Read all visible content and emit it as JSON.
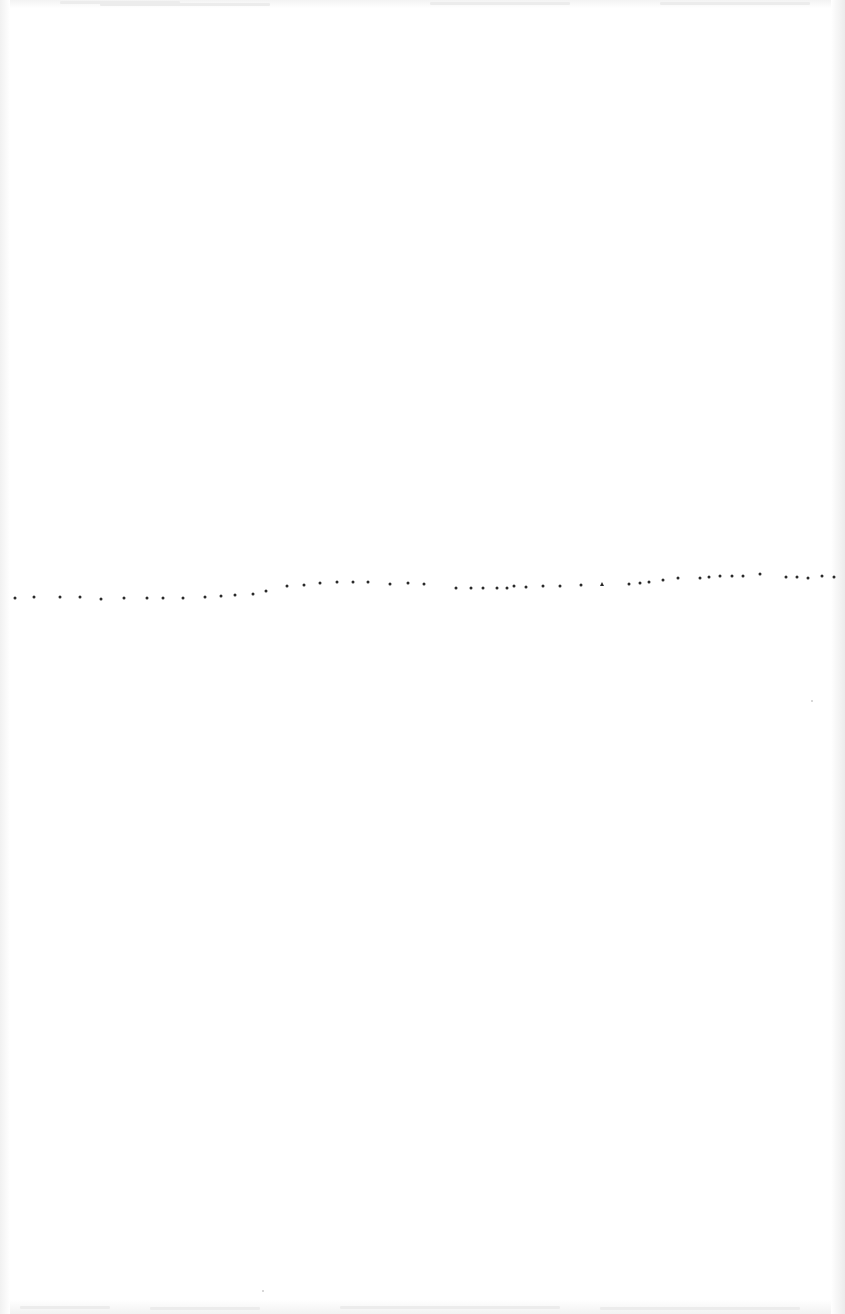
{
  "document": {
    "type": "scanned-page",
    "background_color": "#ffffff",
    "dot_color": "#2a2a2a",
    "visible_text": []
  },
  "dotted_line": {
    "description": "horizontal row of small dots across the middle of the page",
    "points": [
      {
        "x": 15,
        "y": 598
      },
      {
        "x": 34,
        "y": 597
      },
      {
        "x": 60,
        "y": 597
      },
      {
        "x": 80,
        "y": 597
      },
      {
        "x": 101,
        "y": 599
      },
      {
        "x": 124,
        "y": 598
      },
      {
        "x": 147,
        "y": 598
      },
      {
        "x": 163,
        "y": 598
      },
      {
        "x": 183,
        "y": 598
      },
      {
        "x": 205,
        "y": 597
      },
      {
        "x": 221,
        "y": 596
      },
      {
        "x": 235,
        "y": 595
      },
      {
        "x": 253,
        "y": 594
      },
      {
        "x": 266,
        "y": 591
      },
      {
        "x": 287,
        "y": 586
      },
      {
        "x": 304,
        "y": 585
      },
      {
        "x": 320,
        "y": 583
      },
      {
        "x": 337,
        "y": 582
      },
      {
        "x": 353,
        "y": 582
      },
      {
        "x": 368,
        "y": 582
      },
      {
        "x": 390,
        "y": 584
      },
      {
        "x": 408,
        "y": 583
      },
      {
        "x": 424,
        "y": 584
      },
      {
        "x": 456,
        "y": 588
      },
      {
        "x": 471,
        "y": 588
      },
      {
        "x": 483,
        "y": 588
      },
      {
        "x": 497,
        "y": 588
      },
      {
        "x": 507,
        "y": 588
      },
      {
        "x": 514,
        "y": 586
      },
      {
        "x": 526,
        "y": 587
      },
      {
        "x": 543,
        "y": 586
      },
      {
        "x": 560,
        "y": 586
      },
      {
        "x": 581,
        "y": 585
      },
      {
        "x": 602,
        "y": 584,
        "shape": "triangle"
      },
      {
        "x": 629,
        "y": 584
      },
      {
        "x": 640,
        "y": 583
      },
      {
        "x": 649,
        "y": 582
      },
      {
        "x": 663,
        "y": 580
      },
      {
        "x": 678,
        "y": 578
      },
      {
        "x": 700,
        "y": 578
      },
      {
        "x": 709,
        "y": 577
      },
      {
        "x": 720,
        "y": 576
      },
      {
        "x": 732,
        "y": 576
      },
      {
        "x": 743,
        "y": 576
      },
      {
        "x": 760,
        "y": 574
      },
      {
        "x": 786,
        "y": 577
      },
      {
        "x": 797,
        "y": 577
      },
      {
        "x": 808,
        "y": 578
      },
      {
        "x": 822,
        "y": 576
      },
      {
        "x": 834,
        "y": 577
      }
    ]
  },
  "specks": [
    {
      "x": 811,
      "y": 700
    },
    {
      "x": 262,
      "y": 1290
    }
  ]
}
